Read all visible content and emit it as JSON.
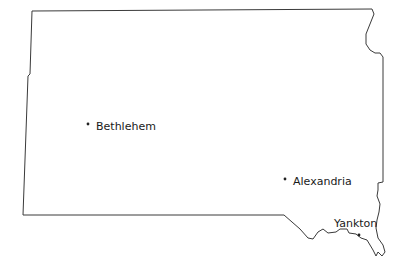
{
  "map": {
    "region": "South Dakota",
    "outline_color": "#3a3a3a",
    "background_color": "#ffffff",
    "cities": [
      {
        "name": "Bethlehem",
        "dot": [
          88,
          124
        ],
        "label_pos": [
          96,
          121
        ]
      },
      {
        "name": "Alexandria",
        "dot": [
          285,
          179
        ],
        "label_pos": [
          293,
          176
        ]
      },
      {
        "name": "Yankton",
        "dot": [
          359,
          235
        ],
        "label_pos": [
          334,
          218
        ]
      }
    ]
  }
}
